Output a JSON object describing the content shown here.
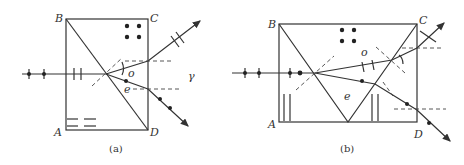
{
  "figures": [
    {
      "id": "a",
      "caption": "(a)",
      "labels": {
        "B": "B",
        "C": "C",
        "A": "A",
        "D": "D",
        "o": "o",
        "e": "e",
        "gamma": "γ"
      }
    },
    {
      "id": "b",
      "caption": "(b)",
      "labels": {
        "B": "B",
        "C": "C",
        "A": "A",
        "D": "D",
        "o": "o",
        "e": "e"
      }
    }
  ],
  "colors": {
    "line": "#333333",
    "background": "#ffffff"
  }
}
